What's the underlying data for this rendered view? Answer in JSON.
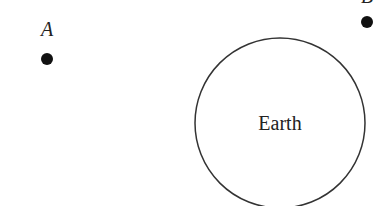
{
  "diagram": {
    "points": [
      {
        "label": "A",
        "cx": 47,
        "cy": 59,
        "label_x": 47,
        "label_y": 36
      },
      {
        "label": "B",
        "cx": 367,
        "cy": 22,
        "label_x": 367,
        "label_y": 3
      }
    ],
    "earth": {
      "label": "Earth",
      "cx": 280,
      "cy": 123,
      "r": 86
    },
    "colors": {
      "stroke": "#333333",
      "dot": "#111111",
      "text": "#222222"
    }
  }
}
